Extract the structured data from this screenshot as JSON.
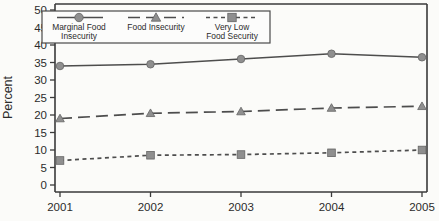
{
  "figure": {
    "background_color": "#fbfbf9",
    "axis_color": "#3a3a3a",
    "line_color": "#4d4d4d",
    "marker_fill": "#8f8f8f",
    "marker_stroke": "#636363",
    "text_color": "#2b2b2b",
    "legend_fill": "#fcfcfb",
    "legend_border_color": "#4a4a4a"
  },
  "chart_data": {
    "type": "line",
    "title": "",
    "xlabel": "",
    "ylabel": "Percent",
    "x": [
      "2001",
      "2002",
      "2003",
      "2004",
      "2005"
    ],
    "ylim": [
      0,
      50
    ],
    "ytick_step": 5,
    "ytick_labels": [
      "0",
      "5",
      "10",
      "15",
      "20",
      "25",
      "30",
      "35",
      "40",
      "45",
      "50"
    ],
    "grid": false,
    "legend_position": "top-left-inside",
    "series": [
      {
        "name": "Marginal Food Insecurity",
        "legend_lines": [
          "Marginal Food",
          "Insecurity"
        ],
        "line_style": "solid",
        "marker": "circle",
        "values": [
          34,
          34.5,
          36,
          37.5,
          36.5
        ]
      },
      {
        "name": "Food Insecurity",
        "legend_lines": [
          "Food Insecurity"
        ],
        "line_style": "long-dash",
        "marker": "triangle",
        "values": [
          19,
          20.5,
          21,
          22,
          22.5
        ]
      },
      {
        "name": "Very Low Food Security",
        "legend_lines": [
          "Very Low",
          "Food Security"
        ],
        "line_style": "short-dash",
        "marker": "square",
        "values": [
          7,
          8.5,
          8.7,
          9.2,
          10
        ]
      }
    ]
  }
}
